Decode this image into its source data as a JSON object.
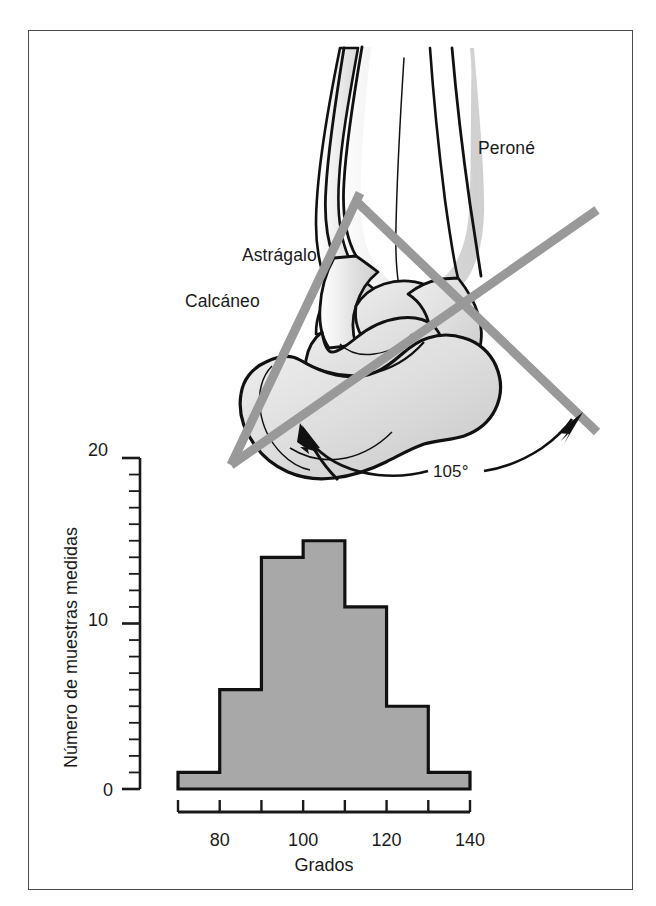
{
  "figure": {
    "border_color": "#4a4a4a",
    "background": "#ffffff"
  },
  "anatomy": {
    "title": "Ankle joint bone diagram with measurement axis",
    "labels": [
      {
        "id": "perone",
        "text": "Peroné"
      },
      {
        "id": "astragalo",
        "text": "Astrágalo"
      },
      {
        "id": "calcaneo",
        "text": "Calcáneo"
      }
    ],
    "angle_annotation": "105°",
    "axis_line_color": "#999999",
    "bone_fill_light": "#e8e8e8",
    "bone_fill_mid": "#d2d2d2",
    "outline_color": "#111111"
  },
  "chart_data": {
    "type": "bar",
    "title": "",
    "subtitle": "",
    "xlabel": "Grados",
    "ylabel": "Número de muestras medidas",
    "categories": [
      "70-80",
      "80-90",
      "90-100",
      "100-110",
      "110-120",
      "120-130",
      "130-140"
    ],
    "bin_edges": [
      70,
      80,
      90,
      100,
      110,
      120,
      130,
      140
    ],
    "values": [
      1,
      6,
      14,
      15,
      11,
      5,
      1
    ],
    "xlim": [
      70,
      140
    ],
    "ylim": [
      0,
      20
    ],
    "x_ticks": [
      70,
      80,
      90,
      100,
      110,
      120,
      130,
      140
    ],
    "x_tick_labels": [
      "",
      "80",
      "",
      "100",
      "",
      "120",
      "",
      "140"
    ],
    "y_ticks_major": [
      0,
      10,
      20
    ],
    "y_tick_labels_major": [
      "0",
      "10",
      "20"
    ],
    "y_minor_tick_step": 1,
    "grid": false,
    "legend": false,
    "bar_fill": "#a8a8a8",
    "bar_stroke": "#111111",
    "axis_color": "#1a1a1a"
  }
}
